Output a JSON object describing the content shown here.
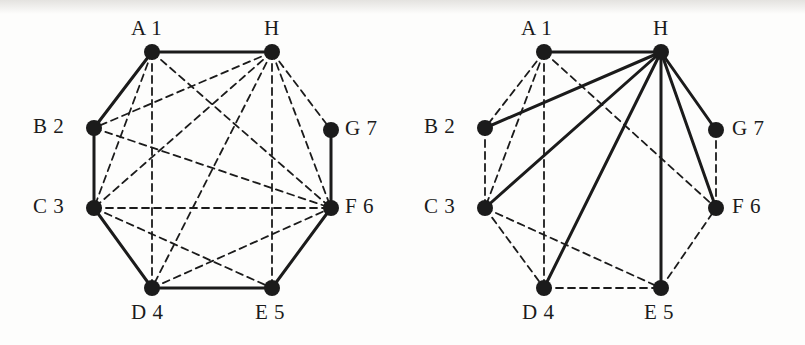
{
  "figure": {
    "title": "",
    "background_color": "#fdfdfc",
    "ink_color": "#1b1b1b"
  },
  "labels": {
    "a": "A 1",
    "b": "B 2",
    "c": "C 3",
    "d": "D 4",
    "e": "E 5",
    "f": "F 6",
    "g": "G 7",
    "h": "H"
  },
  "chart_data": {
    "type": "diagram",
    "subtype": "graph-node-link",
    "panels": [
      {
        "name": "left-graph",
        "nodes": [
          {
            "id": "A",
            "label": "A 1",
            "x": 152,
            "y": 52,
            "label_x": 131,
            "label_y": 18
          },
          {
            "id": "B",
            "label": "B 2",
            "x": 94,
            "y": 128,
            "label_x": 33,
            "label_y": 116
          },
          {
            "id": "C",
            "label": "C 3",
            "x": 94,
            "y": 208,
            "label_x": 33,
            "label_y": 196
          },
          {
            "id": "D",
            "label": "D 4",
            "x": 152,
            "y": 288,
            "label_x": 131,
            "label_y": 302
          },
          {
            "id": "E",
            "label": "E 5",
            "x": 272,
            "y": 288,
            "label_x": 255,
            "label_y": 302
          },
          {
            "id": "F",
            "label": "F 6",
            "x": 331,
            "y": 208,
            "label_x": 345,
            "label_y": 196
          },
          {
            "id": "G",
            "label": "G 7",
            "x": 331,
            "y": 130,
            "label_x": 345,
            "label_y": 118
          },
          {
            "id": "H",
            "label": "H",
            "x": 272,
            "y": 52,
            "label_x": 264,
            "label_y": 18
          }
        ],
        "solid_edges": [
          [
            "A",
            "H"
          ],
          [
            "A",
            "B"
          ],
          [
            "B",
            "C"
          ],
          [
            "C",
            "D"
          ],
          [
            "D",
            "E"
          ],
          [
            "E",
            "F"
          ],
          [
            "F",
            "G"
          ]
        ],
        "dashed_edges": [
          [
            "A",
            "C"
          ],
          [
            "A",
            "D"
          ],
          [
            "A",
            "F"
          ],
          [
            "H",
            "B"
          ],
          [
            "H",
            "C"
          ],
          [
            "H",
            "D"
          ],
          [
            "H",
            "E"
          ],
          [
            "H",
            "F"
          ],
          [
            "H",
            "G"
          ],
          [
            "B",
            "C"
          ],
          [
            "C",
            "E"
          ],
          [
            "C",
            "F"
          ],
          [
            "D",
            "F"
          ],
          [
            "B",
            "F"
          ]
        ]
      },
      {
        "name": "right-graph",
        "nodes": [
          {
            "id": "A",
            "label": "A 1",
            "x": 141,
            "y": 52,
            "label_x": 118,
            "label_y": 18
          },
          {
            "id": "B",
            "label": "B 2",
            "x": 82,
            "y": 128,
            "label_x": 21,
            "label_y": 116
          },
          {
            "id": "C",
            "label": "C 3",
            "x": 82,
            "y": 208,
            "label_x": 21,
            "label_y": 196
          },
          {
            "id": "D",
            "label": "D 4",
            "x": 141,
            "y": 288,
            "label_x": 119,
            "label_y": 302
          },
          {
            "id": "E",
            "label": "E 5",
            "x": 258,
            "y": 288,
            "label_x": 241,
            "label_y": 302
          },
          {
            "id": "F",
            "label": "F 6",
            "x": 313,
            "y": 208,
            "label_x": 329,
            "label_y": 196
          },
          {
            "id": "G",
            "label": "G 7",
            "x": 313,
            "y": 130,
            "label_x": 329,
            "label_y": 118
          },
          {
            "id": "H",
            "label": "H",
            "x": 258,
            "y": 52,
            "label_x": 250,
            "label_y": 18
          }
        ],
        "solid_edges": [
          [
            "H",
            "A"
          ],
          [
            "H",
            "B"
          ],
          [
            "H",
            "C"
          ],
          [
            "H",
            "D"
          ],
          [
            "H",
            "E"
          ],
          [
            "H",
            "F"
          ],
          [
            "H",
            "G"
          ]
        ],
        "dashed_edges": [
          [
            "A",
            "B"
          ],
          [
            "A",
            "C"
          ],
          [
            "A",
            "D"
          ],
          [
            "A",
            "F"
          ],
          [
            "B",
            "C"
          ],
          [
            "C",
            "D"
          ],
          [
            "C",
            "E"
          ],
          [
            "D",
            "E"
          ],
          [
            "E",
            "F"
          ],
          [
            "F",
            "G"
          ]
        ]
      }
    ],
    "node_radius": 8,
    "solid_stroke_width": 3,
    "dashed_stroke_width": 1.8,
    "dash_pattern": "7 5",
    "legend": [],
    "xlabel": "",
    "ylabel": ""
  }
}
